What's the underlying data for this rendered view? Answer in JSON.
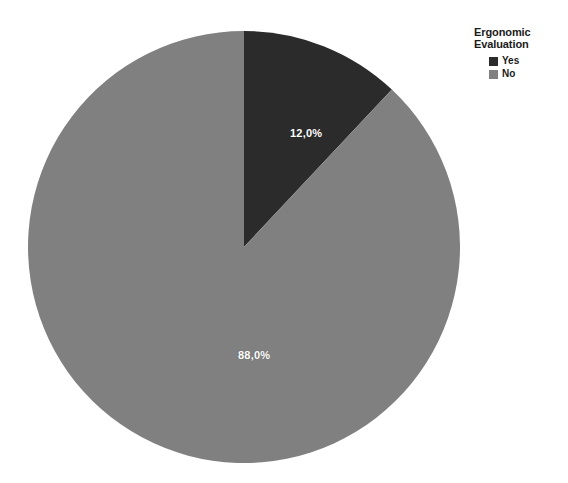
{
  "chart_data": {
    "type": "pie",
    "title": "",
    "legend_title": "Ergonomic\nEvaluation",
    "legend_title_lines": [
      "Ergonomic",
      "Evaluation"
    ],
    "legend_position": "top-right",
    "categories": [
      "Yes",
      "No"
    ],
    "values": [
      12.0,
      88.0
    ],
    "value_unit": "percent",
    "data_labels": [
      "12,0%",
      "88,0%"
    ],
    "colors": [
      "#2b2b2b",
      "#808080"
    ],
    "start_angle_deg": 0,
    "direction": "clockwise",
    "slices": [
      {
        "label": "Yes",
        "value": 12.0,
        "data_label": "12,0%",
        "color": "#2b2b2b",
        "start_angle_deg": 0.0,
        "sweep_angle_deg": 43.2
      },
      {
        "label": "No",
        "value": 88.0,
        "data_label": "88,0%",
        "color": "#808080",
        "start_angle_deg": 43.2,
        "sweep_angle_deg": 316.8
      }
    ],
    "geometry": {
      "center_x": 244,
      "center_y": 247,
      "radius": 216
    },
    "xlabel": "",
    "ylabel": "",
    "grid": false
  },
  "legend": {
    "title_lines": [
      "Ergonomic",
      "Evaluation"
    ],
    "items": [
      {
        "label": "Yes",
        "color": "#2b2b2b"
      },
      {
        "label": "No",
        "color": "#808080"
      }
    ]
  },
  "background_color": "#ffffff"
}
